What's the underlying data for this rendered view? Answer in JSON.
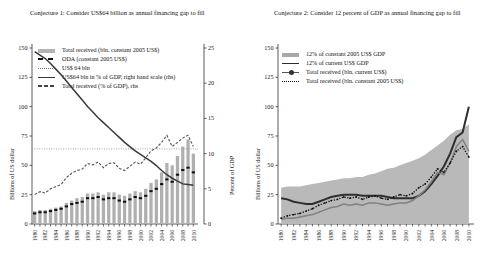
{
  "figure": {
    "panels": [
      {
        "id": "left",
        "title": "Conjecture 1: Consider US$64 billion as annual financing gap to fill",
        "yaxis_left": {
          "label": "Billions of US dollar",
          "min": 0,
          "max": 150,
          "ticks": [
            0,
            25,
            50,
            75,
            100,
            125,
            150
          ]
        },
        "yaxis_right": {
          "label": "Percent of GDP",
          "min": 0,
          "max": 25,
          "ticks": [
            0,
            5,
            10,
            15,
            20,
            25
          ]
        },
        "legend": [
          {
            "key": "bar-gray",
            "label": "Total received (bln. constant 2005 US$)"
          },
          {
            "key": "dashed-black-marker",
            "label": "ODA (constant 2005 US$)"
          },
          {
            "key": "dotted-gray",
            "label": "US$ 64 bln"
          },
          {
            "key": "solid-dark",
            "label": "US$64 bln in % of GDP, right hand scale (rhs)"
          },
          {
            "key": "dashed-gray",
            "label": "Total received (% of GDP), rhs"
          }
        ]
      },
      {
        "id": "right",
        "title": "Conjecture 2: Consider 12 percent of GDP as annual financing gap to fill",
        "yaxis_left": {
          "label": "Billions of US dollar",
          "min": 0,
          "max": 150,
          "ticks": [
            0,
            25,
            50,
            75,
            100,
            125,
            150
          ]
        },
        "legend": [
          {
            "key": "area-gray",
            "label": "12% of constant 2005 US$ GDP"
          },
          {
            "key": "solid-thick-dark",
            "label": "12% of current US$ GDP"
          },
          {
            "key": "line-marker-gray",
            "label": "Total received (bln. current US$)"
          },
          {
            "key": "dotted-black",
            "label": "Total received (bln. constant 2005 US$)"
          }
        ]
      }
    ]
  },
  "chart_data": [
    {
      "type": "bar",
      "title": "Conjecture 1: Consider US$64 billion as annual financing gap to fill",
      "xlabel": "",
      "ylabel": "Billions of US dollar",
      "ylabel_right": "Percent of GDP",
      "ylim": [
        0,
        150
      ],
      "ylim_right": [
        0,
        25
      ],
      "grid": false,
      "legend_position": "top-left",
      "x": [
        1980,
        1981,
        1982,
        1983,
        1984,
        1985,
        1986,
        1987,
        1988,
        1989,
        1990,
        1991,
        1992,
        1993,
        1994,
        1995,
        1996,
        1997,
        1998,
        1999,
        2000,
        2001,
        2002,
        2003,
        2004,
        2005,
        2006,
        2007,
        2008,
        2009,
        2010
      ],
      "xticks": [
        1980,
        1982,
        1984,
        1986,
        1988,
        1990,
        1992,
        1994,
        1996,
        1998,
        2000,
        2002,
        2004,
        2006,
        2008,
        2010
      ],
      "series": [
        {
          "name": "Total received (bln. constant 2005 US$)",
          "type": "bar",
          "axis": "left",
          "color": "#b0b0b0",
          "values": [
            11,
            12,
            12,
            13,
            14,
            15,
            18,
            20,
            22,
            23,
            26,
            26,
            27,
            25,
            27,
            27,
            25,
            24,
            26,
            28,
            27,
            30,
            35,
            38,
            44,
            52,
            50,
            58,
            66,
            72,
            60
          ]
        },
        {
          "name": "ODA (constant 2005 US$)",
          "type": "marker-dash",
          "axis": "left",
          "color": "#111111",
          "values": [
            9,
            10,
            10,
            11,
            12,
            13,
            15,
            17,
            18,
            19,
            22,
            22,
            23,
            21,
            22,
            22,
            20,
            19,
            21,
            23,
            22,
            24,
            28,
            30,
            34,
            38,
            36,
            42,
            46,
            48,
            44
          ]
        },
        {
          "name": "US$ 64 bln",
          "type": "hline",
          "axis": "left",
          "color": "#999999",
          "value": 64
        },
        {
          "name": "US$64 bln in % of GDP, right hand scale (rhs)",
          "type": "line",
          "axis": "right",
          "color": "#3a3a3a",
          "values": [
            24.5,
            24.0,
            23.5,
            22.8,
            22.0,
            21.2,
            20.3,
            19.4,
            18.5,
            17.6,
            16.7,
            15.9,
            15.1,
            14.4,
            13.7,
            13.0,
            12.3,
            11.6,
            11.0,
            10.4,
            9.9,
            9.4,
            8.9,
            8.3,
            7.6,
            7.0,
            6.5,
            6.1,
            5.7,
            5.6,
            5.5
          ]
        },
        {
          "name": "Total received (% of GDP), rhs",
          "type": "dashed-line",
          "axis": "right",
          "color": "#5a5a5a",
          "values": [
            4.2,
            4.6,
            4.4,
            5.0,
            5.3,
            5.6,
            6.6,
            7.2,
            7.6,
            7.8,
            8.6,
            8.4,
            8.8,
            8.0,
            8.6,
            8.7,
            7.9,
            7.6,
            8.2,
            8.8,
            8.5,
            9.4,
            10.4,
            10.8,
            11.6,
            12.6,
            11.0,
            11.6,
            12.2,
            12.6,
            11.0
          ]
        }
      ]
    },
    {
      "type": "area",
      "title": "Conjecture 2: Consider 12 percent of GDP as annual financing gap to fill",
      "xlabel": "",
      "ylabel": "Billions of US dollar",
      "ylim": [
        0,
        150
      ],
      "grid": false,
      "legend_position": "top-left",
      "x": [
        1980,
        1981,
        1982,
        1983,
        1984,
        1985,
        1986,
        1987,
        1988,
        1989,
        1990,
        1991,
        1992,
        1993,
        1994,
        1995,
        1996,
        1997,
        1998,
        1999,
        2000,
        2001,
        2002,
        2003,
        2004,
        2005,
        2006,
        2007,
        2008,
        2009,
        2010
      ],
      "xticks": [
        1980,
        1982,
        1984,
        1986,
        1988,
        1990,
        1992,
        1994,
        1996,
        1998,
        2000,
        2002,
        2004,
        2006,
        2008,
        2010
      ],
      "series": [
        {
          "name": "12% of constant 2005 US$ GDP",
          "type": "area",
          "color": "#b9b9b9",
          "values": [
            31,
            32,
            32,
            32,
            33,
            34,
            35,
            36,
            37,
            38,
            39,
            39,
            40,
            40,
            42,
            43,
            45,
            47,
            48,
            50,
            52,
            54,
            56,
            59,
            63,
            67,
            71,
            76,
            80,
            81,
            85
          ]
        },
        {
          "name": "12% of current US$ GDP",
          "type": "line",
          "color": "#2e2e2e",
          "width": 2.0,
          "values": [
            22,
            21,
            19,
            18,
            17,
            17,
            19,
            21,
            23,
            24,
            25,
            25,
            25,
            24,
            24,
            24,
            24,
            23,
            22,
            22,
            22,
            22,
            24,
            28,
            34,
            41,
            49,
            60,
            74,
            78,
            100
          ]
        },
        {
          "name": "Total received (bln. current US$)",
          "type": "line-marker",
          "color": "#808080",
          "values": [
            4,
            5,
            5,
            6,
            7,
            8,
            10,
            12,
            14,
            15,
            17,
            16,
            17,
            16,
            18,
            18,
            17,
            16,
            17,
            18,
            18,
            20,
            24,
            29,
            36,
            44,
            42,
            52,
            66,
            72,
            62
          ]
        },
        {
          "name": "Total received (bln. constant 2005 US$)",
          "type": "dotted-marker",
          "color": "#111111",
          "values": [
            5,
            7,
            8,
            9,
            11,
            13,
            16,
            18,
            20,
            21,
            23,
            22,
            23,
            21,
            23,
            24,
            22,
            21,
            23,
            25,
            24,
            26,
            31,
            34,
            40,
            47,
            44,
            52,
            62,
            66,
            57
          ]
        }
      ]
    }
  ]
}
